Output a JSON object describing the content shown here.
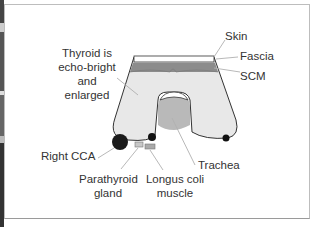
{
  "diagram": {
    "labels": {
      "skin": "Skin",
      "fascia": "Fascia",
      "scm": "SCM",
      "thyroid_line1": "Thyroid is",
      "thyroid_line2": "echo-bright",
      "thyroid_line3": "and",
      "thyroid_line4": "enlarged",
      "right_cca": "Right CCA",
      "parathyroid_line1": "Parathyroid",
      "parathyroid_line2": "gland",
      "longus_line1": "Longus coli",
      "longus_line2": "muscle",
      "trachea": "Trachea"
    },
    "colors": {
      "thyroid_fill": "#e8e8e8",
      "scm_fill": "#8c8c8c",
      "trachea_fill": "#b9b9b9",
      "vessel": "#1a1a1a",
      "leader_line": "#b0b0b0",
      "text": "#333333"
    }
  }
}
